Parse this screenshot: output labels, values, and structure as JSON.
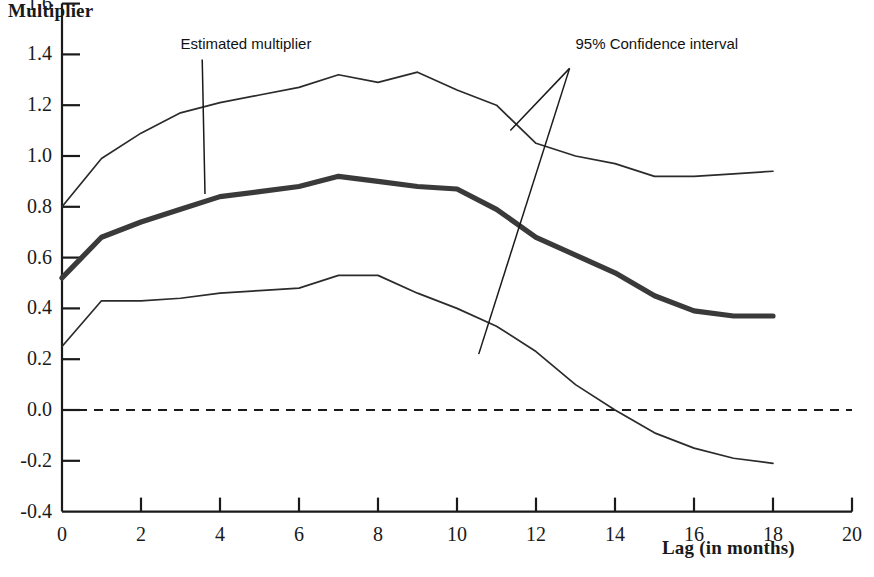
{
  "chart_data": {
    "type": "line",
    "title": "",
    "ylabel": "Multiplier",
    "xlabel": "Lag (in months)",
    "xlim": [
      0,
      20
    ],
    "ylim": [
      -0.4,
      1.6
    ],
    "xticks": [
      0,
      2,
      4,
      6,
      8,
      10,
      12,
      14,
      16,
      18,
      20
    ],
    "xtick_labels": [
      "0",
      "2",
      "4",
      "6",
      "8",
      "10",
      "12",
      "14",
      "16",
      "18",
      "20"
    ],
    "yticks": [
      -0.4,
      -0.2,
      0.0,
      0.2,
      0.4,
      0.6,
      0.8,
      1.0,
      1.2,
      1.4,
      1.6
    ],
    "ytick_labels": [
      "-0.4",
      "-0.2",
      "0.0",
      "0.2",
      "0.4",
      "0.6",
      "0.8",
      "1.0",
      "1.2",
      "1.4",
      "1.6"
    ],
    "grid": false,
    "legend": "none",
    "zero_line": {
      "value": 0.0,
      "style": "dashed",
      "x_from": 0,
      "x_to": 20
    },
    "x": [
      0,
      1,
      2,
      3,
      4,
      5,
      6,
      7,
      8,
      9,
      10,
      11,
      12,
      13,
      14,
      15,
      16,
      17,
      18
    ],
    "series": [
      {
        "name": "95% Confidence interval upper",
        "style": "thin",
        "values": [
          0.8,
          0.99,
          1.09,
          1.17,
          1.21,
          1.24,
          1.27,
          1.32,
          1.29,
          1.33,
          1.26,
          1.2,
          1.05,
          1.0,
          0.97,
          0.92,
          0.92,
          0.93,
          0.94
        ]
      },
      {
        "name": "Estimated multiplier",
        "style": "bold",
        "values": [
          0.52,
          0.68,
          0.74,
          0.79,
          0.84,
          0.86,
          0.88,
          0.92,
          0.9,
          0.88,
          0.87,
          0.79,
          0.68,
          0.61,
          0.54,
          0.45,
          0.39,
          0.37,
          0.37
        ]
      },
      {
        "name": "95% Confidence interval lower",
        "style": "thin",
        "values": [
          0.25,
          0.43,
          0.43,
          0.44,
          0.46,
          0.47,
          0.48,
          0.53,
          0.53,
          0.46,
          0.4,
          0.33,
          0.23,
          0.1,
          0.0,
          -0.09,
          -0.15,
          -0.19,
          -0.21
        ]
      }
    ],
    "annotations": [
      {
        "name": "estimated-multiplier",
        "text": "Estimated multiplier",
        "text_x": 3.0,
        "text_y": 1.44,
        "leaders": [
          {
            "from_x": 3.55,
            "from_y": 1.38,
            "to_x": 3.62,
            "to_y": 0.85
          }
        ]
      },
      {
        "name": "confidence-interval",
        "text": "95% Confidence interval",
        "text_x": 13.0,
        "text_y": 1.44,
        "leaders": [
          {
            "from_x": 12.85,
            "from_y": 1.345,
            "to_x": 11.35,
            "to_y": 1.1
          },
          {
            "from_x": 12.85,
            "from_y": 1.345,
            "to_x": 10.55,
            "to_y": 0.22
          }
        ]
      }
    ],
    "colors": {
      "axis": "#1a1a1a",
      "estimate_line": "#3a3a3a",
      "confidence_line": "#2b2b2b",
      "zero_line": "#1a1a1a",
      "background": "#ffffff"
    }
  },
  "axis_titles": {
    "y": "Multiplier",
    "x": "Lag (in months)"
  }
}
